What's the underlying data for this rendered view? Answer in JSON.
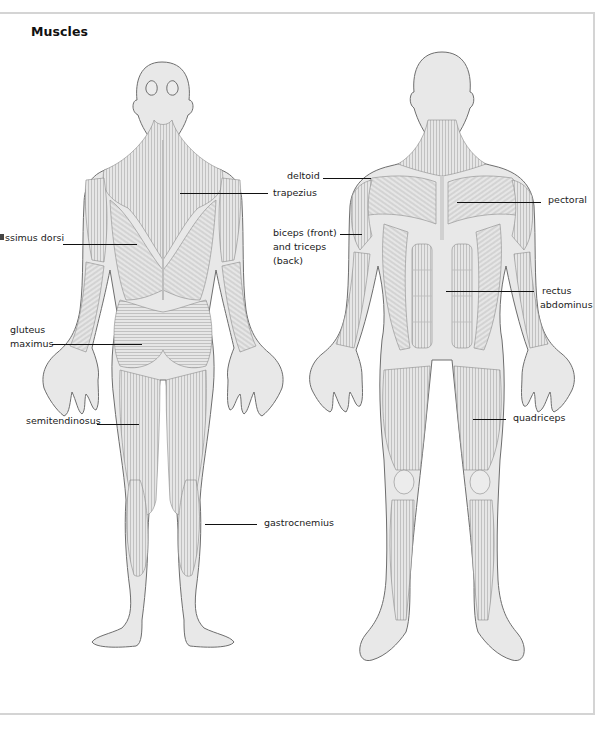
{
  "title": "Muscles",
  "colors": {
    "skin_fill": "#e8e8e8",
    "outline": "#6e6e6e",
    "muscle_hatch": "#9a9a9a",
    "leader_line": "#111111",
    "frame": "#d4d4d4"
  },
  "figures": {
    "back_view": {
      "labels": [
        {
          "text": "trapezius"
        },
        {
          "text": "ssimus dorsi"
        },
        {
          "text": "gluteus"
        },
        {
          "text": "maximus"
        },
        {
          "text": "semitendinosus"
        },
        {
          "text": "gastrocnemius"
        }
      ]
    },
    "front_view": {
      "labels": [
        {
          "text": "deltoid"
        },
        {
          "text": "biceps (front)"
        },
        {
          "text": "and triceps"
        },
        {
          "text": "(back)"
        },
        {
          "text": "pectoral"
        },
        {
          "text": "rectus"
        },
        {
          "text": "abdominus"
        },
        {
          "text": "quadriceps"
        }
      ]
    }
  }
}
